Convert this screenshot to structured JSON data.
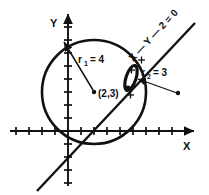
{
  "figure": {
    "type": "geometry-diagram",
    "background": "#ffffff",
    "stroke": "#111111",
    "width": 209,
    "height": 195
  },
  "axes": {
    "x_label": "X",
    "y_label": "Y",
    "origin_px": [
      68,
      131
    ],
    "unit_px": 13,
    "x_axis": {
      "from_px": [
        10,
        131
      ],
      "to_px": [
        196,
        131
      ],
      "arrow": true
    },
    "y_axis": {
      "from_px": [
        68,
        186
      ],
      "to_px": [
        68,
        12
      ],
      "arrow": true
    },
    "x_ticks_units": [
      -4,
      -3,
      -2,
      -1,
      1,
      2,
      3,
      4,
      5,
      6,
      7,
      8,
      9
    ],
    "y_ticks_units": [
      -4,
      -3,
      -2,
      -1,
      1,
      2,
      3,
      4,
      5,
      6,
      7,
      8,
      9
    ],
    "tick_len_px": 7,
    "grid": false
  },
  "circle1": {
    "name": "large-circle",
    "center_units": [
      2,
      3
    ],
    "center_label": "(2,3)",
    "radius_units": 4,
    "radius_label": "r",
    "radius_subscript": "1",
    "radius_value": "= 4",
    "radius_text": "r1 = 4",
    "center_px": [
      94,
      92
    ],
    "radius_px": 52,
    "stroke_width": 2.6
  },
  "circle2": {
    "name": "small-circle",
    "radius_label": "r",
    "radius_subscript": "2",
    "radius_value": "= 3",
    "radius_text": "r2 = 3",
    "center_px": [
      131,
      78
    ],
    "rx_px": 5,
    "ry_px": 13,
    "rotation_deg": 18,
    "stroke_width": 3.2,
    "pointer_from_px": [
      178,
      93
    ],
    "pointer_to_px": [
      137,
      79
    ]
  },
  "line": {
    "name": "straight-line",
    "equation": "X — Y — 2 = 0",
    "equation_plain": "X - Y - 2 = 0",
    "from_px": [
      37,
      191
    ],
    "to_px": [
      196,
      22
    ],
    "stroke_width": 2.4,
    "label_rotation_deg": -47,
    "label_anchor_px": [
      133,
      62
    ]
  },
  "markers": {
    "plus_points": [
      {
        "name": "plus-upper",
        "px": [
          141,
          60
        ]
      },
      {
        "name": "plus-mid",
        "px": [
          131,
          70
        ]
      },
      {
        "name": "plus-lower",
        "px": [
          130,
          94
        ]
      }
    ],
    "dots": [
      {
        "name": "circle1-center-dot",
        "px": [
          94,
          92
        ]
      },
      {
        "name": "intersection-dot",
        "px": [
          128,
          87
        ]
      },
      {
        "name": "r2-pointer-dot",
        "px": [
          178,
          93
        ]
      }
    ]
  },
  "annotations": {
    "r1_arrow": {
      "from_px": [
        93,
        90
      ],
      "to_px": [
        63,
        41
      ]
    }
  }
}
